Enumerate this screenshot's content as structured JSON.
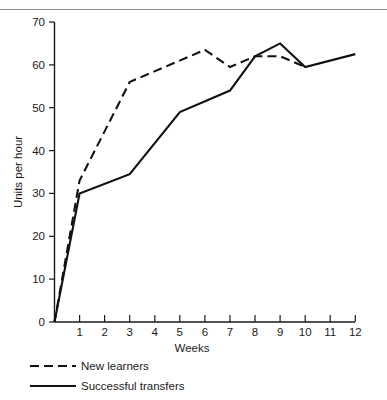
{
  "chart_data": {
    "type": "line",
    "title": "",
    "xlabel": "Weeks",
    "ylabel": "Units per hour",
    "xlim": [
      0,
      12
    ],
    "ylim": [
      0,
      70
    ],
    "x_ticks": [
      1,
      2,
      3,
      4,
      5,
      6,
      7,
      8,
      9,
      10,
      11,
      12
    ],
    "y_ticks": [
      0,
      10,
      20,
      30,
      40,
      50,
      60,
      70
    ],
    "grid": false,
    "legend_position": "below-left",
    "series": [
      {
        "name": "New learners",
        "style": "dashed",
        "color": "#111111",
        "x": [
          0,
          1,
          3,
          6,
          7,
          8,
          9,
          10
        ],
        "values": [
          0,
          33,
          56,
          63.5,
          59.5,
          62,
          62,
          59.5
        ]
      },
      {
        "name": "Successful transfers",
        "style": "solid",
        "color": "#111111",
        "x": [
          0,
          1,
          3,
          5,
          7,
          8,
          9,
          10,
          12
        ],
        "values": [
          0,
          30,
          34.5,
          49,
          54,
          62,
          65,
          59.5,
          62.5
        ]
      }
    ]
  },
  "axes": {
    "y_tick_labels": [
      "0",
      "10",
      "20",
      "30",
      "40",
      "50",
      "60",
      "70"
    ],
    "x_tick_labels": [
      "1",
      "2",
      "3",
      "4",
      "5",
      "6",
      "7",
      "8",
      "9",
      "10",
      "11",
      "12"
    ],
    "x_axis_title": "Weeks",
    "y_axis_title": "Units per hour"
  },
  "legend": {
    "entries": [
      {
        "label": "New learners",
        "style": "dashed"
      },
      {
        "label": "Successful transfers",
        "style": "solid"
      }
    ]
  }
}
